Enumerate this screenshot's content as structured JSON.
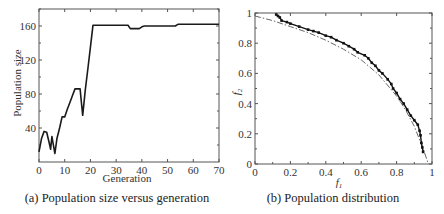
{
  "chart_data": [
    {
      "type": "line",
      "title": "",
      "caption": "(a) Population size versus generation",
      "xlabel": "Generation",
      "ylabel": "Population size",
      "xlim": [
        0,
        70
      ],
      "ylim": [
        0,
        180
      ],
      "xticks": [
        0,
        10,
        20,
        30,
        40,
        50,
        60,
        70
      ],
      "yticks": [
        40,
        80,
        120,
        160
      ],
      "grid": false,
      "legend": null,
      "series": [
        {
          "name": "population size",
          "x": [
            0,
            1,
            2,
            3,
            4,
            4.5,
            5,
            5.5,
            6.2,
            7,
            8,
            9,
            10,
            11,
            12,
            13,
            14,
            15,
            16,
            16.5,
            17,
            18,
            19,
            20,
            21,
            22,
            30,
            34.6,
            35.5,
            39,
            40,
            41,
            50,
            53,
            54,
            60,
            70
          ],
          "y": [
            12,
            28,
            36,
            35,
            22,
            15,
            30,
            22,
            10,
            28,
            40,
            53,
            53,
            62,
            70,
            78,
            86,
            86,
            86,
            70,
            55,
            85,
            110,
            135,
            161,
            161,
            161,
            161,
            157,
            157,
            159,
            160,
            160,
            160,
            162,
            162,
            162
          ]
        }
      ]
    },
    {
      "type": "scatter",
      "title": "",
      "caption": "(b) Population distribution",
      "xlabel": "f1",
      "ylabel": "f2",
      "xlim": [
        0,
        1
      ],
      "ylim": [
        0,
        1
      ],
      "xticks": [
        0,
        0.2,
        0.4,
        0.6,
        0.8,
        1
      ],
      "yticks": [
        0,
        0.2,
        0.4,
        0.6,
        0.8,
        1
      ],
      "xtick_labels": [
        "0",
        "0.2",
        "0.4",
        "0.6",
        "0.8",
        "1"
      ],
      "ytick_labels": [
        "0",
        "0.2",
        "0.4",
        "0.6",
        "0.8",
        "1"
      ],
      "grid": false,
      "legend": null,
      "series": [
        {
          "name": "obtained population",
          "style": "solid dots",
          "x": [
            0.12,
            0.13,
            0.14,
            0.15,
            0.18,
            0.2,
            0.25,
            0.3,
            0.33,
            0.36,
            0.4,
            0.43,
            0.46,
            0.5,
            0.53,
            0.56,
            0.58,
            0.62,
            0.64,
            0.66,
            0.68,
            0.7,
            0.72,
            0.75,
            0.77,
            0.78,
            0.8,
            0.82,
            0.84,
            0.86,
            0.88,
            0.9,
            0.92,
            0.93,
            0.935,
            0.94,
            0.945,
            0.95
          ],
          "y": [
            0.99,
            0.98,
            0.97,
            0.95,
            0.94,
            0.93,
            0.91,
            0.89,
            0.88,
            0.87,
            0.85,
            0.84,
            0.82,
            0.8,
            0.78,
            0.76,
            0.74,
            0.72,
            0.7,
            0.67,
            0.65,
            0.62,
            0.6,
            0.56,
            0.53,
            0.5,
            0.47,
            0.43,
            0.4,
            0.36,
            0.32,
            0.29,
            0.26,
            0.22,
            0.19,
            0.14,
            0.11,
            0.08
          ]
        },
        {
          "name": "true Pareto front",
          "style": "dash-dot",
          "x": [
            0,
            0.1,
            0.2,
            0.3,
            0.4,
            0.5,
            0.6,
            0.7,
            0.8,
            0.85,
            0.9,
            0.95,
            0.98
          ],
          "y": [
            0.98,
            0.95,
            0.91,
            0.87,
            0.82,
            0.76,
            0.69,
            0.59,
            0.45,
            0.36,
            0.25,
            0.1,
            0.0
          ]
        }
      ]
    }
  ],
  "captions": {
    "a": "(a) Population size versus generation",
    "b": "(b) Population distribution"
  },
  "labels": {
    "a_xlabel": "Generation",
    "a_ylabel": "Population size",
    "b_xlabel": "f",
    "b_xlabel_sub": "1",
    "b_ylabel": "f",
    "b_ylabel_sub": "2"
  }
}
